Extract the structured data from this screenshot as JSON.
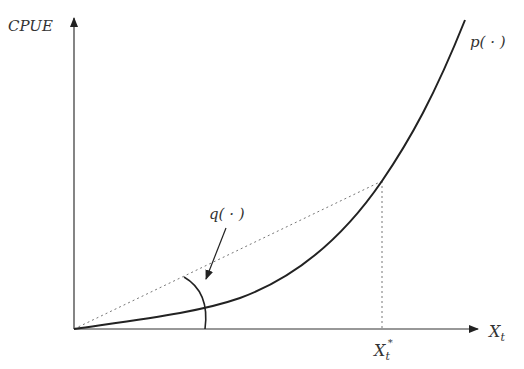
{
  "diagram": {
    "y_axis_label": "CPUE",
    "x_axis_label": "X",
    "x_axis_label_sub": "t",
    "curve_label": "p( · )",
    "angle_label": "q( · )",
    "marker_label": "X",
    "marker_label_sub": "t",
    "marker_label_sup": "*",
    "colors": {
      "ink": "#222222",
      "dotted": "#777777",
      "background": "#ffffff"
    }
  }
}
